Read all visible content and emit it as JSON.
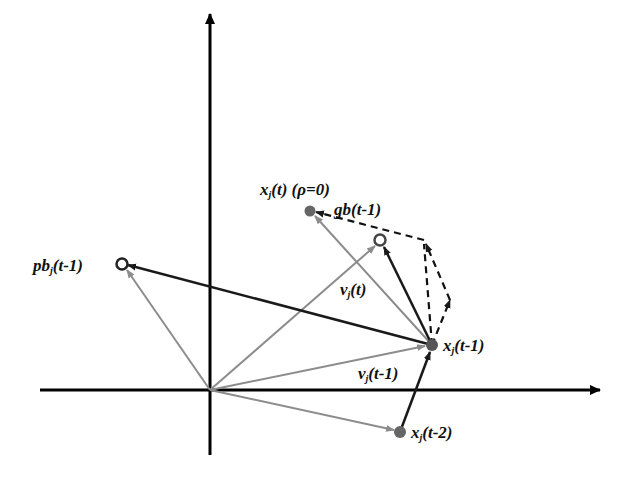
{
  "diagram": {
    "type": "vector-update-diagram",
    "colors": {
      "axis": "#000000",
      "dark_vector": "#1a1a1a",
      "light_vector": "#8c8c8c",
      "point_fill": "#666666",
      "dashed": "#111111"
    },
    "origin": {
      "x": 210,
      "y": 390
    },
    "points": [
      {
        "id": "pb",
        "x": 122,
        "y": 264,
        "style": "hollow"
      },
      {
        "id": "x_t",
        "x": 310,
        "y": 211,
        "style": "filled"
      },
      {
        "id": "gb",
        "x": 380,
        "y": 240,
        "style": "hollow"
      },
      {
        "id": "x_t_minus_1",
        "x": 432,
        "y": 345,
        "style": "filled"
      },
      {
        "id": "x_t_minus_2",
        "x": 400,
        "y": 432,
        "style": "filled"
      }
    ],
    "labels": {
      "x_t": {
        "var": "x",
        "sub": "j",
        "arg": "(t)",
        "extra": "(ρ=0)"
      },
      "gb": {
        "var": "gb",
        "arg": "(t-1)"
      },
      "pb": {
        "var": "pb",
        "sub": "j",
        "arg": "(t-1)"
      },
      "v_t": {
        "var": "v",
        "sub": "j",
        "arg": "(t)"
      },
      "x_t_minus_1": {
        "var": "x",
        "sub": "j",
        "arg": "(t-1)"
      },
      "v_t_minus_1": {
        "var": "v",
        "sub": "j",
        "arg": "(t-1)"
      },
      "x_t_minus_2": {
        "var": "x",
        "sub": "j",
        "arg": "(t-2)"
      }
    }
  }
}
